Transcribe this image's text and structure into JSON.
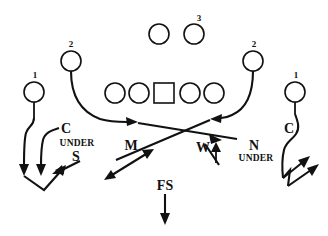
{
  "diagram": {
    "type": "football-play-diagram",
    "width": 328,
    "height": 236,
    "background_color": "#ffffff",
    "ink_color": "#111111"
  },
  "offense": {
    "line_label": "offensive-line",
    "linemen": [
      {
        "id": "lt",
        "shape": "circle",
        "x": 115,
        "y": 93,
        "r": 10
      },
      {
        "id": "lg",
        "shape": "circle",
        "x": 139,
        "y": 93,
        "r": 10
      },
      {
        "id": "center",
        "shape": "square",
        "x": 164,
        "y": 93,
        "size": 20
      },
      {
        "id": "rg",
        "shape": "circle",
        "x": 190,
        "y": 93,
        "r": 10
      },
      {
        "id": "rt",
        "shape": "circle",
        "x": 214,
        "y": 93,
        "r": 10
      }
    ],
    "backs": [
      {
        "id": "back-left",
        "shape": "circle",
        "x": 159,
        "y": 34,
        "r": 10,
        "label": ""
      },
      {
        "id": "back-right",
        "shape": "circle",
        "x": 194,
        "y": 34,
        "r": 10,
        "label": "3"
      }
    ],
    "receivers": [
      {
        "id": "wr-far-left",
        "shape": "circle",
        "x": 34,
        "y": 92,
        "r": 10,
        "label": "1"
      },
      {
        "id": "wr-slot-left",
        "shape": "circle",
        "x": 71,
        "y": 61,
        "r": 10,
        "label": "2"
      },
      {
        "id": "wr-slot-right",
        "shape": "circle",
        "x": 253,
        "y": 61,
        "r": 10,
        "label": "2"
      },
      {
        "id": "wr-far-right",
        "shape": "circle",
        "x": 295,
        "y": 92,
        "r": 10,
        "label": "1"
      }
    ]
  },
  "defense": {
    "labels": [
      {
        "id": "corner-left",
        "text": "C",
        "x": 66,
        "y": 133,
        "size": 14
      },
      {
        "id": "strong-safety",
        "text": "S",
        "x": 74,
        "y": 160,
        "size": 14
      },
      {
        "id": "mike-linebacker",
        "text": "M",
        "x": 131,
        "y": 148,
        "size": 14
      },
      {
        "id": "will-linebacker",
        "text": "W",
        "x": 204,
        "y": 150,
        "size": 14
      },
      {
        "id": "nickel",
        "text": "N",
        "x": 254,
        "y": 148,
        "size": 14
      },
      {
        "id": "corner-right",
        "text": "C",
        "x": 290,
        "y": 133,
        "size": 14
      },
      {
        "id": "free-safety",
        "text": "FS",
        "x": 165,
        "y": 190,
        "size": 14
      }
    ],
    "zones": [
      {
        "id": "under-left",
        "text": "UNDER",
        "x": 76,
        "y": 146
      },
      {
        "id": "under-right",
        "text": "UNDER",
        "x": 255,
        "y": 160
      }
    ]
  },
  "numbers": {
    "receiver_one_left": "1",
    "receiver_two_left": "2",
    "back_three": "3",
    "receiver_two_right": "2",
    "receiver_one_right": "1"
  },
  "legend": {
    "under_text": "UNDER",
    "corner_text": "C",
    "strong_safety_text": "S",
    "mike_text": "M",
    "will_text": "W",
    "nickel_text": "N",
    "free_safety_text": "FS"
  }
}
